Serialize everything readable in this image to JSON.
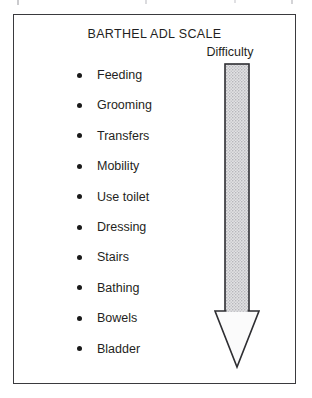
{
  "figure": {
    "title": "BARTHEL ADL SCALE",
    "frame": {
      "border_color": "#3a3a3e",
      "background": "#ffffff"
    }
  },
  "adl_items": [
    {
      "label": "Feeding",
      "bullet": "filled-round-bullet"
    },
    {
      "label": "Grooming",
      "bullet": "filled-round-bullet"
    },
    {
      "label": "Transfers",
      "bullet": "filled-round-bullet"
    },
    {
      "label": "Mobility",
      "bullet": "filled-round-bullet"
    },
    {
      "label": "Use toilet",
      "bullet": "filled-round-bullet"
    },
    {
      "label": "Dressing",
      "bullet": "filled-round-bullet"
    },
    {
      "label": "Stairs",
      "bullet": "filled-round-bullet"
    },
    {
      "label": "Bathing",
      "bullet": "filled-round-bullet"
    },
    {
      "label": "Bowels",
      "bullet": "filled-round-bullet"
    },
    {
      "label": "Bladder",
      "bullet": "filled-round-bullet"
    }
  ],
  "difficulty_arrow": {
    "label": "Difficulty",
    "direction": "down",
    "icon": "down-arrow-icon",
    "shaft_fill": "#d4d4d6",
    "head_fill": "#fbfbfb",
    "outline_color": "#2e2e32",
    "meaning_top": "Feeding",
    "meaning_bottom": "Bladder"
  },
  "colors": {
    "text": "#1f1f22",
    "outline": "#2e2e32",
    "frame": "#3a3a3e",
    "page": "#ffffff"
  }
}
